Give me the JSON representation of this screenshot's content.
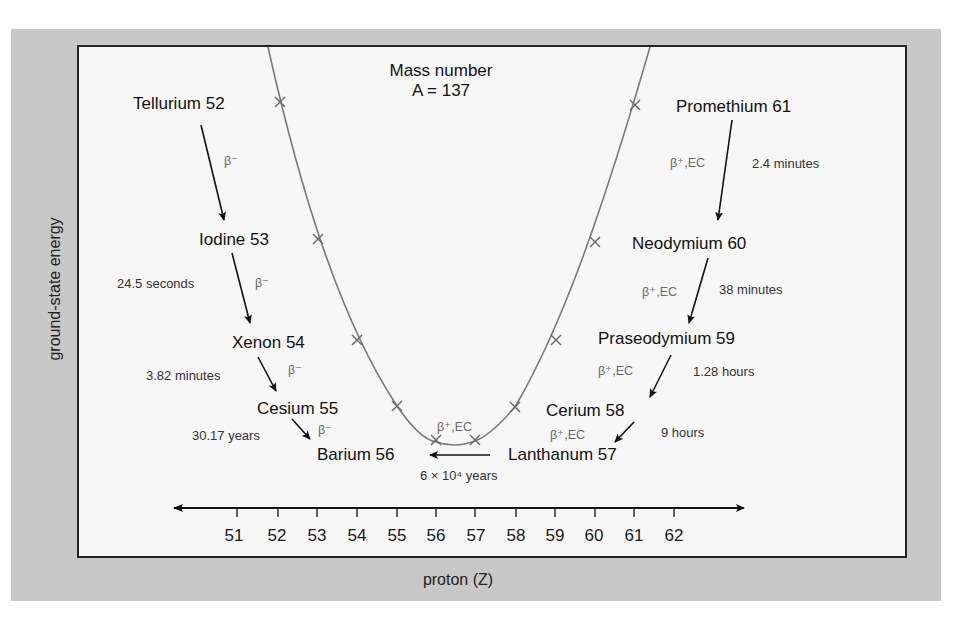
{
  "title": {
    "line1": "Mass number",
    "line2": "A = 137"
  },
  "axes": {
    "x_title": "proton (Z)",
    "y_title": "ground-state energy",
    "ticks": [
      "51",
      "52",
      "53",
      "54",
      "55",
      "56",
      "57",
      "58",
      "59",
      "60",
      "61",
      "62"
    ]
  },
  "isotopes": [
    {
      "label": "Tellurium 52",
      "z": 52
    },
    {
      "label": "Iodine 53",
      "z": 53
    },
    {
      "label": "Xenon 54",
      "z": 54
    },
    {
      "label": "Cesium 55",
      "z": 55
    },
    {
      "label": "Barium 56",
      "z": 56
    },
    {
      "label": "Lanthanum 57",
      "z": 57
    },
    {
      "label": "Cerium 58",
      "z": 58
    },
    {
      "label": "Praseodymium 59",
      "z": 59
    },
    {
      "label": "Neodymium 60",
      "z": 60
    },
    {
      "label": "Promethium 61",
      "z": 61
    }
  ],
  "decays": [
    {
      "from": "Tellurium 52",
      "to": "Iodine 53",
      "mode": "β⁻",
      "half_life": ""
    },
    {
      "from": "Iodine 53",
      "to": "Xenon 54",
      "mode": "β⁻",
      "half_life": "24.5 seconds"
    },
    {
      "from": "Xenon 54",
      "to": "Cesium 55",
      "mode": "β⁻",
      "half_life": "3.82 minutes"
    },
    {
      "from": "Cesium 55",
      "to": "Barium 56",
      "mode": "β⁻",
      "half_life": "30.17 years"
    },
    {
      "from": "Lanthanum 57",
      "to": "Barium 56",
      "mode": "β⁺,EC",
      "half_life": "6 × 10⁴ years"
    },
    {
      "from": "Cerium 58",
      "to": "Lanthanum 57",
      "mode": "β⁺,EC",
      "half_life": "9 hours"
    },
    {
      "from": "Praseodymium 59",
      "to": "Cerium 58",
      "mode": "β⁺,EC",
      "half_life": "1.28 hours"
    },
    {
      "from": "Neodymium 60",
      "to": "Praseodymium 59",
      "mode": "β⁺,EC",
      "half_life": "38 minutes"
    },
    {
      "from": "Promethium 61",
      "to": "Neodymium 60",
      "mode": "β⁺,EC",
      "half_life": "2.4 minutes"
    }
  ],
  "labels": {
    "beta_minus": "β⁻",
    "beta_plus_ec": "β⁺,EC",
    "hl_iodine": "24.5 seconds",
    "hl_xenon": "3.82 minutes",
    "hl_cesium": "30.17 years",
    "hl_lanthanum": "6 × 10⁴ years",
    "hl_cerium": "9 hours",
    "hl_praseodymium": "1.28 hours",
    "hl_neodymium": "38 minutes",
    "hl_promethium": "2.4 minutes"
  },
  "colors": {
    "frame_bg": "#c8c8c8",
    "panel_bg": "#f7f7f7",
    "curve": "#777777",
    "text": "#111111",
    "mode_text": "#6a6a6a"
  }
}
